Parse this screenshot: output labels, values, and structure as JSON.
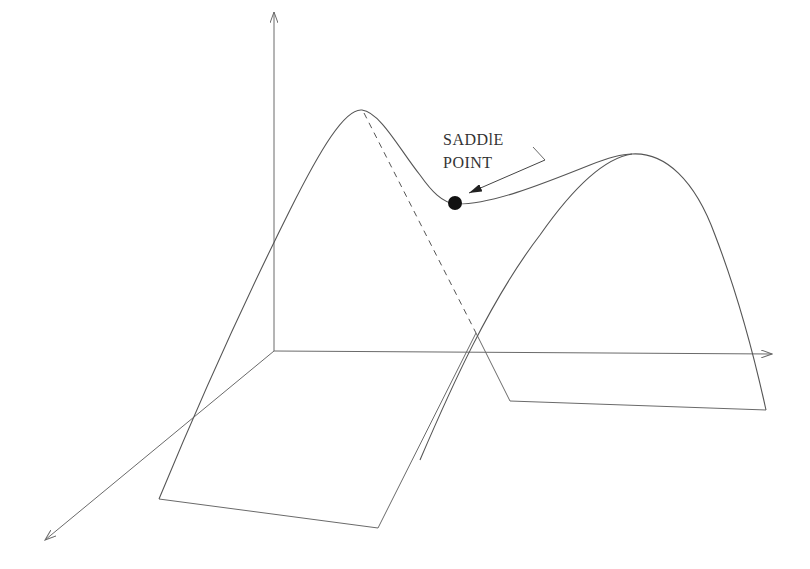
{
  "diagram": {
    "type": "3d-surface-sketch",
    "label": {
      "line1": "SADDlE",
      "line2": "POINT"
    },
    "colors": {
      "line": "#6a6a6a",
      "curve": "#555555",
      "point": "#111111",
      "background": "#ffffff"
    },
    "axes": {
      "origin": [
        274,
        351
      ],
      "vertical_tip": [
        274,
        12
      ],
      "horizontal_tip": [
        772,
        353
      ],
      "depth_tip": [
        45,
        540
      ]
    },
    "saddle_point": {
      "center": [
        455,
        203
      ],
      "radius": 7
    }
  }
}
